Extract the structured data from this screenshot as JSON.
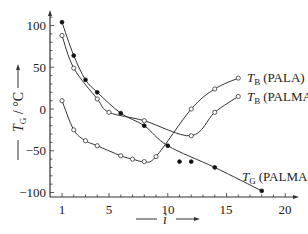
{
  "chart_data": {
    "type": "line",
    "title": "",
    "xlabel": "i",
    "ylabel": "T_G / °C",
    "xlim": [
      0,
      21
    ],
    "ylim": [
      -105,
      120
    ],
    "x_ticks": [
      1,
      5,
      10,
      15,
      20
    ],
    "y_ticks": [
      100,
      50,
      0,
      -50,
      -100
    ],
    "grid": false,
    "legend": "inline labels",
    "series": [
      {
        "name": "T_G (PALA)",
        "marker": "filled",
        "points": [
          [
            1,
            104
          ],
          [
            2,
            64
          ],
          [
            3,
            35
          ],
          [
            4,
            20
          ],
          [
            6,
            -5
          ],
          [
            8,
            -20
          ],
          [
            10,
            -44
          ],
          [
            14,
            -70
          ],
          [
            18,
            -98
          ]
        ],
        "label": ""
      },
      {
        "name": "T_G (PALMA)",
        "marker": "open",
        "points": [
          [
            1,
            88
          ],
          [
            2,
            49
          ],
          [
            4,
            12
          ],
          [
            5,
            -4
          ],
          [
            8,
            -14
          ],
          [
            12,
            -32
          ],
          [
            14,
            -4
          ],
          [
            16,
            15
          ]
        ],
        "label": "T_B (PALMA)"
      },
      {
        "name": "T_B (PALA)",
        "marker": "open",
        "points": [
          [
            1,
            10
          ],
          [
            2,
            -25
          ],
          [
            3,
            -38
          ],
          [
            4,
            -44
          ],
          [
            6,
            -56
          ],
          [
            7,
            -60
          ],
          [
            8,
            -63
          ],
          [
            9,
            -57
          ],
          [
            12,
            0
          ],
          [
            14,
            24
          ],
          [
            16,
            37
          ]
        ],
        "label": "T_B (PALA)"
      },
      {
        "name": "isolated",
        "marker": "filled",
        "points": [
          [
            11,
            -63
          ],
          [
            12,
            -63
          ]
        ],
        "label": ""
      }
    ],
    "annotations": [
      {
        "text_main": "T",
        "text_sub": "B",
        "text_rest": " (PALA)",
        "x": 16,
        "y": 37
      },
      {
        "text_main": "T",
        "text_sub": "B",
        "text_rest": " (PALMA)",
        "x": 16,
        "y": 15
      },
      {
        "text_main": "T",
        "text_sub": "G",
        "text_rest": " (PALMA)",
        "x": 18,
        "y": -98
      }
    ]
  },
  "labels": {
    "x_axis": "i",
    "y_axis_main": "T",
    "y_axis_sub": "G",
    "y_axis_rest": " / °C",
    "tb_pala_main": "T",
    "tb_pala_sub": "B",
    "tb_pala_rest": "(PALA)",
    "tb_palma_main": "T",
    "tb_palma_sub": "B",
    "tb_palma_rest": "(PALMA)",
    "tg_palma_main": "T",
    "tg_palma_sub": "G",
    "tg_palma_rest": "(PALMA)",
    "xtick_1": "1",
    "xtick_5": "5",
    "xtick_10": "10",
    "xtick_15": "15",
    "xtick_20": "20",
    "ytick_100": "100",
    "ytick_50": "50",
    "ytick_0": "0",
    "ytick_m50": "−50",
    "ytick_m100": "−100"
  },
  "colors": {
    "line": "#333333",
    "text": "#222222",
    "background": "#ffffff"
  }
}
